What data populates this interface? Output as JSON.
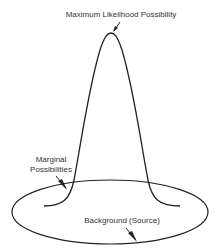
{
  "labels": {
    "peak": "Maximum Likelihood Possibility",
    "marginal_line1": "Marginal",
    "marginal_line2": "Possibilities",
    "background": "Background (Source)"
  },
  "colors": {
    "stroke": "#222222",
    "text": "#333333",
    "background": "#ffffff"
  }
}
